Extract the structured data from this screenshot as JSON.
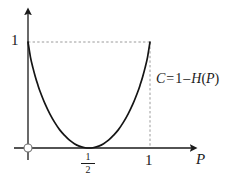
{
  "figure": {
    "background_color": "#ffffff",
    "ink_color": "#1a1a1a",
    "guide_color": "#9a9a9a",
    "axis_labels": {
      "x_axis_title": "P",
      "y_one": "1",
      "x_one": "1",
      "x_half_numerator": "1",
      "x_half_denominator": "2"
    },
    "annotation": {
      "lhs": "C",
      "equals": "=",
      "one": "1",
      "minus": "–",
      "entropy": "H",
      "open_paren": "(",
      "arg": "P",
      "close_paren": ")",
      "full_text": "C = 1 – H(P)"
    },
    "markers": {
      "origin_marker": "open-circle"
    }
  },
  "chart_data": {
    "type": "line",
    "title": "",
    "subtitle": "",
    "xlabel": "P",
    "ylabel": "",
    "xlim": [
      0,
      1
    ],
    "ylim": [
      0,
      1
    ],
    "grid": false,
    "legend": null,
    "xticks": [
      0.5,
      1
    ],
    "xticklabels": [
      "1/2",
      "1"
    ],
    "yticks": [
      1
    ],
    "yticklabels": [
      "1"
    ],
    "annotations": [
      {
        "text": "C = 1 – H(P)",
        "x": 1.05,
        "y": 0.62,
        "describes": "capacity curve"
      }
    ],
    "guides": [
      {
        "type": "hline",
        "y": 1,
        "x_from": 0,
        "x_to": 1,
        "style": "dashed"
      },
      {
        "type": "vline",
        "x": 1,
        "y_from": 0,
        "y_to": 1,
        "style": "dashed"
      }
    ],
    "series": [
      {
        "name": "C = 1 - H(P)",
        "formula": "C = 1 + P*log2(P) + (1-P)*log2(1-P)",
        "x": [
          0,
          0.02,
          0.04,
          0.06,
          0.08,
          0.1,
          0.14,
          0.18,
          0.22,
          0.26,
          0.3,
          0.34,
          0.38,
          0.42,
          0.46,
          0.5,
          0.54,
          0.58,
          0.62,
          0.66,
          0.7,
          0.74,
          0.78,
          0.82,
          0.86,
          0.9,
          0.92,
          0.94,
          0.96,
          0.98,
          1
        ],
        "y": [
          1,
          0.858,
          0.758,
          0.673,
          0.598,
          0.531,
          0.416,
          0.32,
          0.239,
          0.171,
          0.119,
          0.074,
          0.041,
          0.018,
          0.005,
          0,
          0.005,
          0.018,
          0.041,
          0.074,
          0.119,
          0.171,
          0.239,
          0.32,
          0.416,
          0.531,
          0.598,
          0.673,
          0.758,
          0.858,
          1
        ]
      }
    ]
  }
}
